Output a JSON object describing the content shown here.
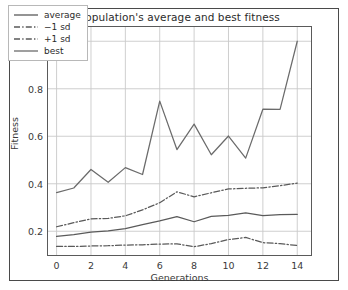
{
  "chart_data": {
    "type": "line",
    "title": "Population's average and best fitness",
    "xlabel": "Generations",
    "ylabel": "Fitness",
    "xlim": [
      -0.5,
      14.8
    ],
    "ylim": [
      0.1,
      1.06
    ],
    "grid": true,
    "legend_position": "upper left",
    "xticks": [
      0,
      2,
      4,
      6,
      8,
      10,
      12,
      14
    ],
    "xtick_labels": [
      "0",
      "2",
      "4",
      "6",
      "8",
      "10",
      "12",
      "14"
    ],
    "yticks": [
      0.2,
      0.4,
      0.6,
      0.8,
      1.0
    ],
    "ytick_labels": [
      "0.2",
      "0.4",
      "0.6",
      "0.8",
      "1.0"
    ],
    "x": [
      0,
      1,
      2,
      3,
      4,
      5,
      6,
      7,
      8,
      9,
      10,
      11,
      12,
      13,
      14
    ],
    "series": [
      {
        "name": "average",
        "style": "solid",
        "color": "#5a5a5a",
        "values": [
          0.178,
          0.186,
          0.196,
          0.202,
          0.211,
          0.228,
          0.244,
          0.262,
          0.24,
          0.263,
          0.267,
          0.277,
          0.266,
          0.27,
          0.271
        ]
      },
      {
        "name": "-1 sd",
        "style": "dashdot",
        "color": "#5a5a5a",
        "values": [
          0.136,
          0.136,
          0.138,
          0.139,
          0.142,
          0.143,
          0.146,
          0.147,
          0.135,
          0.148,
          0.165,
          0.174,
          0.152,
          0.148,
          0.14
        ]
      },
      {
        "name": "+1 sd",
        "style": "dashdot",
        "color": "#5a5a5a",
        "values": [
          0.219,
          0.236,
          0.252,
          0.254,
          0.265,
          0.29,
          0.32,
          0.366,
          0.345,
          0.362,
          0.378,
          0.381,
          0.383,
          0.392,
          0.403
        ]
      },
      {
        "name": "best",
        "style": "solid",
        "color": "#6b6b6b",
        "values": [
          0.363,
          0.382,
          0.46,
          0.406,
          0.468,
          0.439,
          0.748,
          0.544,
          0.651,
          0.522,
          0.601,
          0.508,
          0.714,
          0.713,
          1.0
        ]
      }
    ]
  },
  "legend": {
    "items": [
      {
        "label": "average"
      },
      {
        "label": "−1 sd"
      },
      {
        "label": "+1 sd"
      },
      {
        "label": "best"
      }
    ]
  }
}
